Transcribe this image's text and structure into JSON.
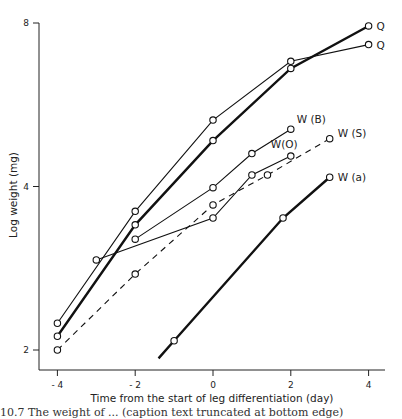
{
  "chart_data": {
    "type": "line",
    "title": "",
    "xlabel": "Time from the start of leg differentiation  (day)",
    "ylabel": "Log weight (mg)",
    "xlim": [
      -4.5,
      4.5
    ],
    "ylim": [
      1.8,
      8.2
    ],
    "yscale": "log2",
    "grid": false,
    "legend": "inline labels at line ends",
    "x_ticks": [
      -4,
      -2,
      0,
      2,
      4
    ],
    "x_tick_labels": [
      "- 4",
      "- 2",
      "0",
      "2",
      "4"
    ],
    "y_ticks": [
      2,
      4,
      8
    ],
    "y_tick_labels": [
      "2",
      "4",
      "8"
    ],
    "series": [
      {
        "name": "Q",
        "style": "thick",
        "x": [
          -4,
          -2,
          0,
          2,
          4
        ],
        "values": [
          2.12,
          3.4,
          4.86,
          6.6,
          7.9
        ]
      },
      {
        "name": "Q",
        "style": "thin",
        "x": [
          -4,
          -2,
          0,
          2,
          4
        ],
        "values": [
          2.24,
          3.6,
          5.3,
          6.8,
          7.3
        ]
      },
      {
        "name": "W (B)",
        "style": "thin",
        "x": [
          -2,
          0,
          1,
          2
        ],
        "values": [
          3.2,
          3.98,
          4.6,
          5.1
        ]
      },
      {
        "name": "W (S)",
        "style": "dashed",
        "x": [
          -4,
          -2,
          0,
          1.4,
          3
        ],
        "values": [
          2.0,
          2.76,
          3.7,
          4.2,
          4.9
        ]
      },
      {
        "name": "W(O)",
        "style": "thin",
        "x": [
          -3,
          0,
          1,
          2
        ],
        "values": [
          2.93,
          3.5,
          4.2,
          4.55
        ]
      },
      {
        "name": "W (a)",
        "style": "thick",
        "x": [
          -1.4,
          -1,
          1.8,
          3
        ],
        "values": [
          1.93,
          2.08,
          3.5,
          4.16
        ],
        "markers": [
          false,
          true,
          true,
          true
        ]
      }
    ]
  },
  "caption": "10.7  The weight of ... (caption text truncated at bottom edge)"
}
